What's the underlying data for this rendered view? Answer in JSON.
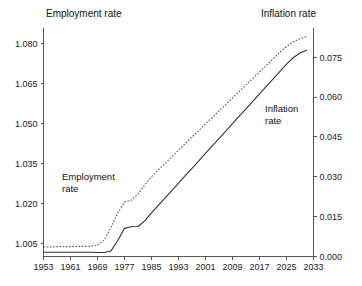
{
  "chart_data": {
    "type": "line",
    "title": "",
    "subtitle": "",
    "xlabel": "",
    "ylabel": "Employment rate",
    "y2label": "Inflation rate",
    "grid": false,
    "legend_position": "inline-annotation",
    "x": [
      1953,
      1955,
      1957,
      1959,
      1961,
      1963,
      1965,
      1967,
      1969,
      1971,
      1973,
      1975,
      1977,
      1979,
      1981,
      1983,
      1985,
      1987,
      1989,
      1991,
      1993,
      1995,
      1997,
      1999,
      2001,
      2003,
      2005,
      2007,
      2009,
      2011,
      2013,
      2015,
      2017,
      2019,
      2021,
      2023,
      2025,
      2027,
      2029,
      2031
    ],
    "xlim": [
      1953,
      2033
    ],
    "xticks": [
      1953,
      1961,
      1969,
      1977,
      1985,
      1993,
      2001,
      2009,
      2017,
      2025,
      2033
    ],
    "xtick_labels": [
      "1953",
      "1961",
      "1969",
      "1977",
      "1985",
      "1993",
      "2001",
      "2009",
      "2017",
      "2025",
      "2033"
    ],
    "ylim": [
      1.0,
      1.0845
    ],
    "yticks": [
      1.005,
      1.02,
      1.035,
      1.05,
      1.065,
      1.08
    ],
    "ytick_labels": [
      "1.005",
      "1.020",
      "1.035",
      "1.050",
      "1.065",
      "1.080"
    ],
    "y2lim": [
      0.0,
      0.0845
    ],
    "y2ticks": [
      0.0,
      0.015,
      0.03,
      0.045,
      0.06,
      0.075
    ],
    "y2tick_labels": [
      "0.000",
      "0.015",
      "0.030",
      "0.045",
      "0.060",
      "0.075"
    ],
    "series": [
      {
        "name": "Employment rate",
        "axis": "left",
        "style": "dotted",
        "color": "#555555",
        "annotation": "Employment rate",
        "values": [
          1.0036,
          1.0036,
          1.0037,
          1.0037,
          1.0037,
          1.0038,
          1.0038,
          1.0039,
          1.0042,
          1.0062,
          1.011,
          1.0165,
          1.0205,
          1.0212,
          1.0235,
          1.027,
          1.03,
          1.0325,
          1.035,
          1.0375,
          1.04,
          1.0425,
          1.045,
          1.0474,
          1.0499,
          1.0523,
          1.0548,
          1.0572,
          1.0597,
          1.0621,
          1.0646,
          1.067,
          1.0695,
          1.0719,
          1.0744,
          1.0768,
          1.079,
          1.0808,
          1.082,
          1.0828
        ]
      },
      {
        "name": "Inflation rate",
        "axis": "right",
        "style": "solid",
        "color": "#333333",
        "annotation": "Inflation rate",
        "values": [
          0.0016,
          0.0016,
          0.0016,
          0.0016,
          0.0016,
          0.0016,
          0.0016,
          0.0016,
          0.0015,
          0.0015,
          0.0021,
          0.006,
          0.0106,
          0.0112,
          0.0113,
          0.0134,
          0.0164,
          0.0192,
          0.022,
          0.0248,
          0.0276,
          0.0304,
          0.0332,
          0.036,
          0.0388,
          0.0416,
          0.0444,
          0.0472,
          0.05,
          0.0528,
          0.0556,
          0.0584,
          0.0612,
          0.064,
          0.0668,
          0.0696,
          0.0724,
          0.0748,
          0.0766,
          0.0776
        ]
      }
    ]
  },
  "labels": {
    "top_left_title": "Employment rate",
    "top_right_title": "Inflation rate",
    "inline_employment_line1": "Employment",
    "inline_employment_line2": "rate",
    "inline_inflation_line1": "Inflation",
    "inline_inflation_line2": "rate"
  },
  "colors": {
    "background": "#ffffff",
    "axis": "#555555",
    "text": "#111111",
    "employment_series": "#555555",
    "inflation_series": "#333333"
  }
}
